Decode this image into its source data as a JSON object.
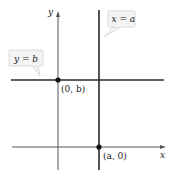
{
  "diagram": {
    "type": "coordinate-plane",
    "axes": {
      "x_label": "x",
      "y_label": "y"
    },
    "lines": [
      {
        "id": "vertical",
        "equation": "x = a"
      },
      {
        "id": "horizontal",
        "equation": "y = b"
      }
    ],
    "points": [
      {
        "label": "(0, b)",
        "description": "intersection of y = b with y-axis"
      },
      {
        "label": "(a, 0)",
        "description": "intersection of x = a with x-axis"
      }
    ],
    "callouts": {
      "vertical_line": "x = a",
      "horizontal_line": "y = b"
    },
    "colors": {
      "line": "#2a2a2a",
      "callout_fill": "#f4f4f4",
      "callout_stroke": "#d0d0d0",
      "point": "#111111"
    }
  }
}
